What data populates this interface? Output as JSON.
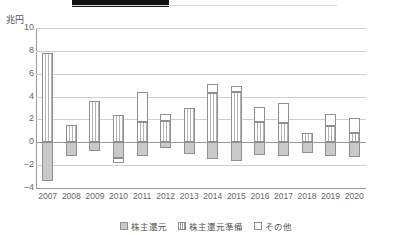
{
  "header": {
    "title_bar_present": true
  },
  "axis": {
    "y_unit_label": "兆円",
    "y_ticks": [
      "10",
      "8",
      "6",
      "4",
      "2",
      "0",
      "-2",
      "-4"
    ]
  },
  "legend": {
    "items": [
      {
        "key": "return",
        "label": "株主還元",
        "swatch": "solid-grey-swatch"
      },
      {
        "key": "prep",
        "label": "株主還元準備",
        "swatch": "striped-swatch"
      },
      {
        "key": "other",
        "label": "その他",
        "swatch": "white-swatch"
      }
    ]
  },
  "chart_data": {
    "type": "bar",
    "title": "",
    "subtitle": "",
    "xlabel": "",
    "ylabel": "兆円",
    "ylim": [
      -4,
      10
    ],
    "ytick_step": 2,
    "grid": true,
    "stacked": true,
    "legend_position": "bottom",
    "categories": [
      "2007",
      "2008",
      "2009",
      "2010",
      "2011",
      "2012",
      "2013",
      "2014",
      "2015",
      "2016",
      "2017",
      "2018",
      "2019",
      "2020"
    ],
    "series": [
      {
        "name": "株主還元",
        "values": [
          -3.4,
          -1.2,
          -0.8,
          -1.4,
          -1.2,
          -0.5,
          -1.0,
          -1.5,
          -1.6,
          -1.1,
          -1.2,
          -0.9,
          -1.2,
          -1.3
        ]
      },
      {
        "name": "株主還元準備",
        "values": [
          7.8,
          1.5,
          3.6,
          2.4,
          1.8,
          1.9,
          3.0,
          4.3,
          4.4,
          1.8,
          1.7,
          0.8,
          1.4,
          0.8
        ]
      },
      {
        "name": "その他",
        "values": [
          0,
          0,
          0,
          0.4,
          2.6,
          0.6,
          0,
          0.8,
          0.5,
          1.3,
          1.7,
          0,
          1.1,
          1.3
        ]
      }
    ],
    "series_tops": {
      "株主還元準備": [
        7.8,
        1.5,
        3.6,
        2.4,
        1.8,
        1.9,
        3.0,
        4.3,
        4.4,
        1.8,
        1.7,
        0.8,
        1.4,
        0.8
      ],
      "その他_top": [
        null,
        null,
        null,
        -1.0,
        4.4,
        2.5,
        null,
        5.1,
        4.9,
        3.1,
        3.4,
        null,
        2.5,
        2.1
      ]
    }
  }
}
